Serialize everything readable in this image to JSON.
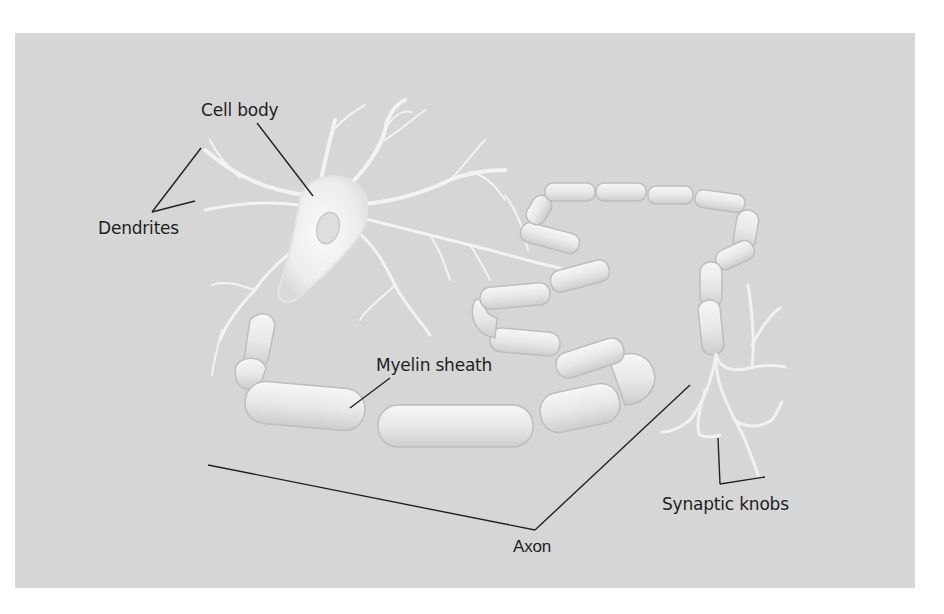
{
  "figure": {
    "background_color": "#d6d6d6",
    "labels": {
      "cell_body": "Cell body",
      "dendrites": "Dendrites",
      "myelin_sheath": "Myelin sheath",
      "synaptic_knobs": "Synaptic knobs",
      "axon": "Axon"
    }
  }
}
